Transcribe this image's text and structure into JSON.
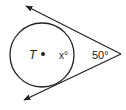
{
  "diagram": {
    "type": "geometry-circle-tangents",
    "center_label": "T",
    "arc_label": "x°",
    "angle_label": "50°",
    "colors": {
      "stroke": "#222222",
      "background": "#ffffff"
    }
  }
}
